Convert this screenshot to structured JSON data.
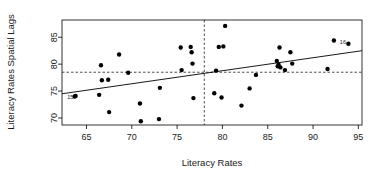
{
  "chart_data": {
    "type": "scatter",
    "title": "",
    "xlabel": "Literacy Rates",
    "ylabel": "Literacy Rates Spatial Lags",
    "xlim": [
      62.3,
      95.4
    ],
    "ylim": [
      68.7,
      88.2
    ],
    "xticks": [
      65,
      70,
      75,
      80,
      85,
      90,
      95
    ],
    "yticks": [
      70,
      75,
      80,
      85
    ],
    "grid": false,
    "legend": null,
    "points": [
      {
        "x": 63.7,
        "y": 74.0,
        "label": "15"
      },
      {
        "x": 63.8,
        "y": 74.1,
        "label": ""
      },
      {
        "x": 66.4,
        "y": 74.3,
        "label": ""
      },
      {
        "x": 66.6,
        "y": 79.8,
        "label": ""
      },
      {
        "x": 66.7,
        "y": 77.0,
        "label": ""
      },
      {
        "x": 67.4,
        "y": 77.1,
        "label": ""
      },
      {
        "x": 67.5,
        "y": 71.1,
        "label": ""
      },
      {
        "x": 68.6,
        "y": 81.8,
        "label": ""
      },
      {
        "x": 69.6,
        "y": 78.4,
        "label": ""
      },
      {
        "x": 70.9,
        "y": 72.7,
        "label": ""
      },
      {
        "x": 71.0,
        "y": 69.4,
        "label": ""
      },
      {
        "x": 73.0,
        "y": 69.8,
        "label": ""
      },
      {
        "x": 73.1,
        "y": 75.6,
        "label": ""
      },
      {
        "x": 75.4,
        "y": 83.1,
        "label": ""
      },
      {
        "x": 75.5,
        "y": 78.9,
        "label": ""
      },
      {
        "x": 76.5,
        "y": 83.2,
        "label": ""
      },
      {
        "x": 76.6,
        "y": 82.2,
        "label": ""
      },
      {
        "x": 76.7,
        "y": 80.1,
        "label": ""
      },
      {
        "x": 76.8,
        "y": 73.7,
        "label": ""
      },
      {
        "x": 79.1,
        "y": 74.6,
        "label": ""
      },
      {
        "x": 79.3,
        "y": 78.8,
        "label": ""
      },
      {
        "x": 79.6,
        "y": 83.2,
        "label": ""
      },
      {
        "x": 79.9,
        "y": 73.8,
        "label": ""
      },
      {
        "x": 80.1,
        "y": 83.3,
        "label": ""
      },
      {
        "x": 80.3,
        "y": 87.1,
        "label": ""
      },
      {
        "x": 82.1,
        "y": 72.3,
        "label": ""
      },
      {
        "x": 83.0,
        "y": 75.5,
        "label": ""
      },
      {
        "x": 83.7,
        "y": 78.0,
        "label": ""
      },
      {
        "x": 86.0,
        "y": 80.6,
        "label": ""
      },
      {
        "x": 86.1,
        "y": 79.6,
        "label": ""
      },
      {
        "x": 86.2,
        "y": 79.9,
        "label": ""
      },
      {
        "x": 86.3,
        "y": 83.1,
        "label": ""
      },
      {
        "x": 86.4,
        "y": 79.4,
        "label": ""
      },
      {
        "x": 86.9,
        "y": 78.9,
        "label": ""
      },
      {
        "x": 87.5,
        "y": 82.2,
        "label": ""
      },
      {
        "x": 87.7,
        "y": 80.1,
        "label": ""
      },
      {
        "x": 91.6,
        "y": 79.1,
        "label": ""
      },
      {
        "x": 92.3,
        "y": 84.4,
        "label": ""
      },
      {
        "x": 93.9,
        "y": 83.8,
        "label": "16"
      }
    ],
    "fit_line": {
      "x1": 62.3,
      "y1": 74.5,
      "x2": 95.4,
      "y2": 82.5
    },
    "hline": 78.5,
    "vline": 78.0
  }
}
